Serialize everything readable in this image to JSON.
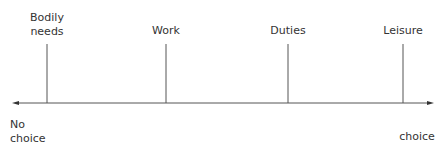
{
  "diagram": {
    "markers": [
      {
        "label": "Bodily\nneeds",
        "x": 47
      },
      {
        "label": "Work",
        "x": 166
      },
      {
        "label": "Duties",
        "x": 288
      },
      {
        "label": "Leisure",
        "x": 403
      }
    ],
    "left_end": "No\nchoice",
    "right_end": "choice",
    "line_color": "#555555"
  }
}
